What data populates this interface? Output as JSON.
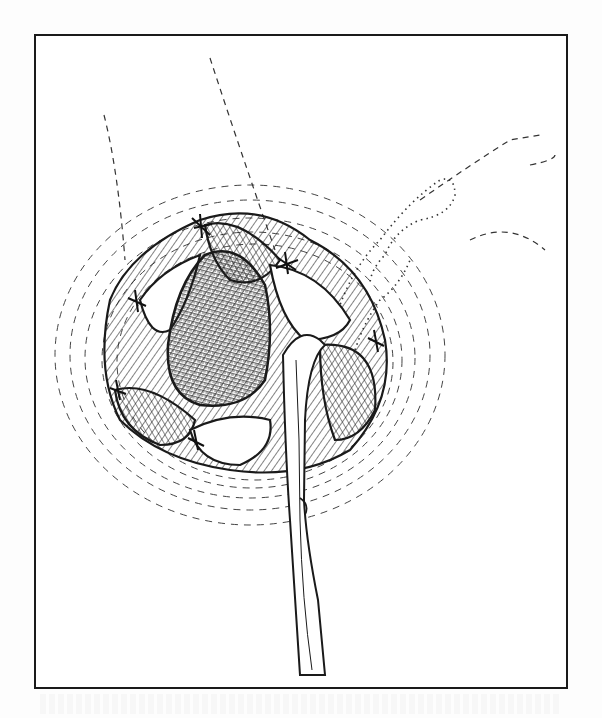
{
  "figure": {
    "kind": "surgical line illustration",
    "text_labels": [],
    "colors": {
      "ink": "#1a1a1a",
      "paper": "#ffffff",
      "frame": "#1a1a1a"
    },
    "elements": [
      {
        "name": "frame",
        "description": "rectangular border"
      },
      {
        "name": "dashed-guide-lines",
        "count": 3,
        "description": "dashed incision/guide lines descending from top"
      },
      {
        "name": "dotted-outline",
        "description": "dotted branching outline at upper right"
      },
      {
        "name": "hatched-tissue-rings",
        "description": "concentric dashed hatching around wound"
      },
      {
        "name": "central-cavity",
        "description": "densely cross-hatched cavity"
      },
      {
        "name": "tissue-flaps",
        "description": "rolled tissue flaps joined by sutures"
      },
      {
        "name": "sutures",
        "count": 6,
        "description": "suture knots at flap junctions"
      },
      {
        "name": "drainage-tube",
        "description": "tube emerging from wound down to bottom edge"
      }
    ]
  }
}
